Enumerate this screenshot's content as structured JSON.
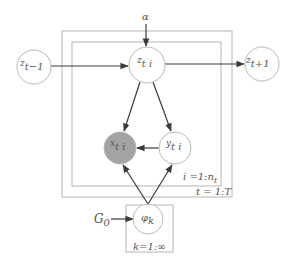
{
  "diagram": {
    "type": "plate-notation-graphical-model",
    "hyperparameters": {
      "alpha": {
        "base": "α",
        "sub": ""
      },
      "G0": {
        "base": "G",
        "sub": "0"
      }
    },
    "nodes": {
      "z_prev": {
        "base": "z",
        "sub": "t−1",
        "observed": false
      },
      "z_ti": {
        "base": "z",
        "sub": "t i",
        "observed": false
      },
      "z_next": {
        "base": "z",
        "sub": "t+1",
        "observed": false
      },
      "x_ti": {
        "base": "x",
        "sub": "t i",
        "observed": true
      },
      "y_ti": {
        "base": "y",
        "sub": "t i",
        "observed": false
      },
      "phi_k": {
        "base": "φ",
        "sub": "k",
        "observed": false
      }
    },
    "plates": {
      "inner": {
        "label": "i =1:n",
        "label_sub": "t"
      },
      "outer": {
        "label": "t = 1:T"
      },
      "components": {
        "label": "k=1:∞"
      }
    },
    "edges": [
      [
        "alpha",
        "z_ti"
      ],
      [
        "z_prev",
        "z_ti"
      ],
      [
        "z_ti",
        "z_next"
      ],
      [
        "z_ti",
        "x_ti"
      ],
      [
        "z_ti",
        "y_ti"
      ],
      [
        "y_ti",
        "x_ti"
      ],
      [
        "phi_k",
        "x_ti"
      ],
      [
        "phi_k",
        "y_ti"
      ],
      [
        "G0",
        "phi_k"
      ]
    ],
    "colors": {
      "observed_fill": "#a3a3a3",
      "node_stroke": "#b8b8b8",
      "plate_stroke": "#b4b4b4",
      "edge": "#3a3a3a"
    }
  }
}
